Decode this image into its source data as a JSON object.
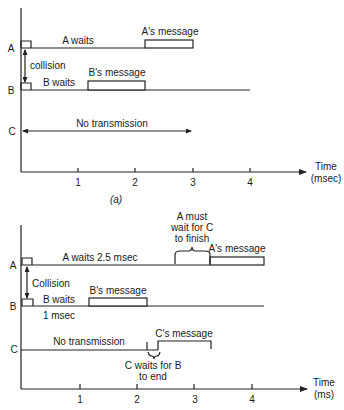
{
  "figure": {
    "panel_a": {
      "caption": "(a)",
      "stations": [
        {
          "name": "A",
          "wait_label": "A waits",
          "message_label": "A's message"
        },
        {
          "name": "B",
          "wait_label": "B waits",
          "message_label": "B's message"
        },
        {
          "name": "C",
          "wait_label": "No transmission"
        }
      ],
      "collision_label": "collision",
      "x_axis": {
        "label_line1": "Time",
        "label_line2": "(msec)",
        "ticks": [
          "1",
          "2",
          "3",
          "4"
        ]
      }
    },
    "panel_b": {
      "stations": [
        {
          "name": "A",
          "wait_label": "A waits 2.5 msec",
          "message_label": "A's message"
        },
        {
          "name": "B",
          "wait_label": "B waits",
          "wait_label_2": "1 msec",
          "message_label": "B's message"
        },
        {
          "name": "C",
          "wait_label": "No transmission",
          "message_label": "C's message"
        }
      ],
      "collision_label": "Collision",
      "annotation_a": {
        "line1": "A must",
        "line2": "wait for C",
        "line3": "to finish"
      },
      "annotation_c": {
        "line1": "C waits for B",
        "line2": "to end"
      },
      "x_axis": {
        "label_line1": "Time",
        "label_line2": "(ms)",
        "ticks": [
          "1",
          "2",
          "3",
          "4"
        ]
      }
    }
  }
}
